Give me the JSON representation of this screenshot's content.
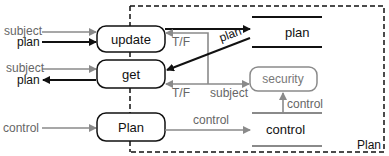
{
  "diagram": {
    "colors": {
      "black": "#111111",
      "gray": "#8a8a8a",
      "dash": "#111111"
    },
    "processes": {
      "update": "update",
      "get": "get",
      "plan": "Plan"
    },
    "stores": {
      "plan": "plan",
      "control": "control"
    },
    "security_box": "security",
    "container_label": "Plan",
    "inputs": {
      "update_subject": "subject",
      "update_plan": "plan",
      "get_subject": "subject",
      "get_plan": "plan",
      "plan_control": "control"
    },
    "edges": {
      "tf_update": "T/F",
      "plan_to_get": "plan",
      "tf_get": "T/F",
      "subject_to_security": "subject",
      "control_to_store": "control",
      "control_to_security": "control"
    }
  }
}
